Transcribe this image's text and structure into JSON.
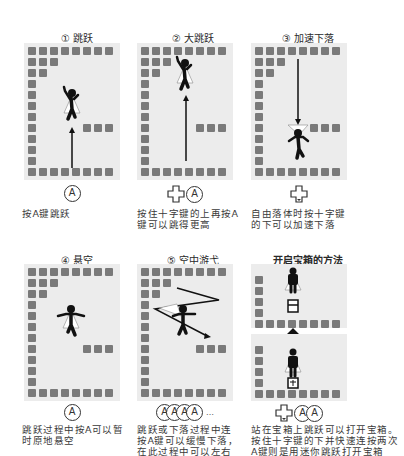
{
  "panels": [
    {
      "title": "① 跳跃",
      "buttons": [
        "A"
      ],
      "description": "按A键跳跃"
    },
    {
      "title": "② 大跳跃",
      "buttons": [
        "dpad",
        "A"
      ],
      "description": "按住十字键的上再按A键可以跳得更高"
    },
    {
      "title": "③ 加速下落",
      "buttons": [
        "dpad"
      ],
      "description": "自由落体时按十字键的下可以加速下落"
    },
    {
      "title": "④ 悬空",
      "buttons": [
        "A"
      ],
      "description": "跳跃过程中按A可以暂时原地悬空"
    },
    {
      "title": "⑤ 空中游弋",
      "buttons": [
        "A",
        "A",
        "A",
        "A"
      ],
      "buttons_suffix": "…",
      "description": "跳跃或下落过程中连按A键可以缓慢下落，在此过程中可以左右移动"
    },
    {
      "title": "开启宝箱的方法",
      "buttons": [
        "dpad",
        "A",
        "A"
      ],
      "description": "站在宝箱上跳跃可以打开宝箱。按住十字键的下并快速连按两次A键则是用迷你跳跃打开宝箱"
    }
  ],
  "button_label": "A",
  "colors": {
    "block": "#7a7a7a",
    "panel_bg": "#ececec",
    "figure": "#111111"
  }
}
